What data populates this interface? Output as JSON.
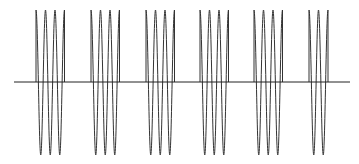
{
  "diagram": {
    "type": "burst-sine-waveform",
    "colors": {
      "background": "#ffffff",
      "axis": "#222222",
      "wave": "#333333"
    },
    "axis": {
      "x_start": 14,
      "x_end": 350,
      "y": 82
    },
    "amplitude": {
      "top": 10,
      "bottom": 155
    },
    "cycle_width": 9.5,
    "bursts": [
      {
        "start_x": 36,
        "cycles": 3
      },
      {
        "start_x": 91,
        "cycles": 3
      },
      {
        "start_x": 146,
        "cycles": 3
      },
      {
        "start_x": 200,
        "cycles": 3
      },
      {
        "start_x": 254,
        "cycles": 3
      },
      {
        "start_x": 309,
        "cycles": 2
      }
    ]
  }
}
